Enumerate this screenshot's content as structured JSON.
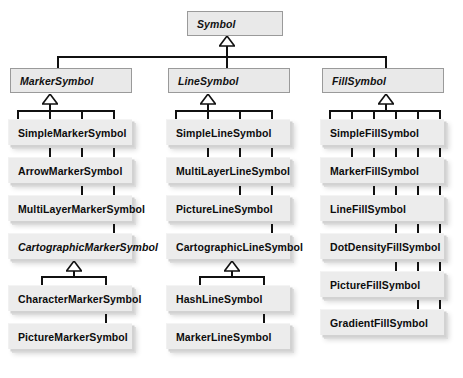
{
  "diagram": {
    "type": "uml-class-hierarchy",
    "root": {
      "name": "Symbol",
      "abstract": true
    },
    "branches": [
      {
        "name": "MarkerSymbol",
        "abstract": true,
        "children": [
          {
            "name": "SimpleMarkerSymbol",
            "abstract": false
          },
          {
            "name": "ArrowMarkerSymbol",
            "abstract": false
          },
          {
            "name": "MultiLayerMarkerSymbol",
            "abstract": false
          },
          {
            "name": "CartographicMarkerSymbol",
            "abstract": true,
            "children": [
              {
                "name": "CharacterMarkerSymbol",
                "abstract": false
              },
              {
                "name": "PictureMarkerSymbol",
                "abstract": false
              }
            ]
          }
        ]
      },
      {
        "name": "LineSymbol",
        "abstract": true,
        "children": [
          {
            "name": "SimpleLineSymbol",
            "abstract": false
          },
          {
            "name": "MultiLayerLineSymbol",
            "abstract": false
          },
          {
            "name": "PictureLineSymbol",
            "abstract": false
          },
          {
            "name": "CartographicLineSymbol",
            "abstract": false,
            "children": [
              {
                "name": "HashLineSymbol",
                "abstract": false
              },
              {
                "name": "MarkerLineSymbol",
                "abstract": false
              }
            ]
          }
        ]
      },
      {
        "name": "FillSymbol",
        "abstract": true,
        "children": [
          {
            "name": "SimpleFillSymbol",
            "abstract": false
          },
          {
            "name": "MarkerFillSymbol",
            "abstract": false
          },
          {
            "name": "LineFillSymbol",
            "abstract": false
          },
          {
            "name": "DotDensityFillSymbol",
            "abstract": false
          },
          {
            "name": "PictureFillSymbol",
            "abstract": false
          },
          {
            "name": "GradientFillSymbol",
            "abstract": false
          }
        ]
      }
    ]
  },
  "labels": {
    "root": "Symbol",
    "marker": "MarkerSymbol",
    "line": "LineSymbol",
    "fill": "FillSymbol",
    "m1": "SimpleMarkerSymbol",
    "m2": "ArrowMarkerSymbol",
    "m3": "MultiLayerMarkerSymbol",
    "m4": "CartographicMarkerSymbol",
    "m5": "CharacterMarkerSymbol",
    "m6": "PictureMarkerSymbol",
    "l1": "SimpleLineSymbol",
    "l2": "MultiLayerLineSymbol",
    "l3": "PictureLineSymbol",
    "l4": "CartographicLineSymbol",
    "l5": "HashLineSymbol",
    "l6": "MarkerLineSymbol",
    "f1": "SimpleFillSymbol",
    "f2": "MarkerFillSymbol",
    "f3": "LineFillSymbol",
    "f4": "DotDensityFillSymbol",
    "f5": "PictureFillSymbol",
    "f6": "GradientFillSymbol"
  },
  "colors": {
    "box_fill": "#ececec",
    "box_border": "#9a9a9a",
    "connector": "#111111",
    "background": "#ffffff"
  }
}
